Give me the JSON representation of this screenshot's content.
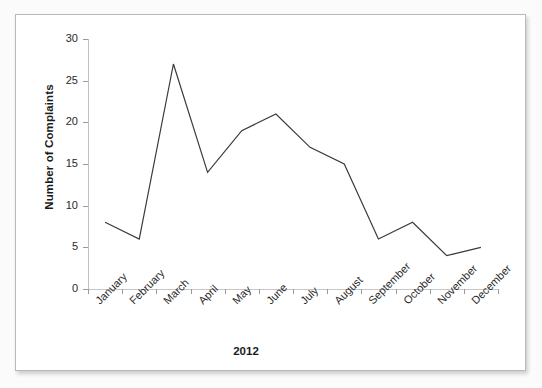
{
  "chart_data": {
    "type": "line",
    "title": "",
    "xlabel": "2012",
    "ylabel": "Number of Complaints",
    "categories": [
      "January",
      "February",
      "March",
      "April",
      "May",
      "June",
      "July",
      "August",
      "September",
      "October",
      "November",
      "December"
    ],
    "values": [
      8,
      6,
      27,
      14,
      19,
      21,
      17,
      15,
      6,
      8,
      4,
      5
    ],
    "series": [
      {
        "name": "Number of Complaints",
        "values": [
          8,
          6,
          27,
          14,
          19,
          21,
          17,
          15,
          6,
          8,
          4,
          5
        ],
        "color": "#3a3a3a"
      }
    ],
    "ylim": [
      0,
      30
    ],
    "yticks": [
      0,
      5,
      10,
      15,
      20,
      25,
      30
    ],
    "ytick_labels": [
      "0",
      "5",
      "10",
      "15",
      "20",
      "25",
      "30"
    ],
    "grid": false,
    "legend": false,
    "legend_position": "none",
    "xtick_label_rotation": -45
  },
  "figure": {
    "y_axis_title": "Number of Complaints",
    "x_axis_title": "2012"
  },
  "colors": {
    "line": "#3a3a3a",
    "axis": "#c0c0c0",
    "tick": "#9a9a9a",
    "text": "#2a2a2a",
    "card_border": "#b9b9b9",
    "card_background": "#ffffff",
    "page_background": "#fbfbfb"
  }
}
